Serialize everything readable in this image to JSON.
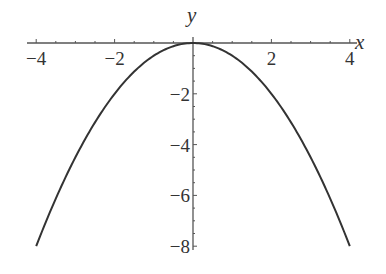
{
  "chart_data": {
    "type": "line",
    "title": "",
    "function": "y = -x^2/2",
    "xlabel": "x",
    "ylabel": "y",
    "xlim": [
      -4,
      4
    ],
    "ylim": [
      -8,
      0
    ],
    "x_ticks": [
      -4,
      -2,
      2,
      4
    ],
    "x_tick_labels": [
      "-4",
      "-2",
      "2",
      "4"
    ],
    "y_ticks": [
      -2,
      -4,
      -6,
      -8
    ],
    "y_tick_labels": [
      "-2",
      "-4",
      "-6",
      "-8"
    ],
    "grid": false,
    "legend": null,
    "series": [
      {
        "name": "parabola",
        "x": [
          -4,
          -3,
          -2,
          -1,
          0,
          1,
          2,
          3,
          4
        ],
        "y": [
          -8,
          -4.5,
          -2,
          -0.5,
          0,
          -0.5,
          -2,
          -4.5,
          -8
        ]
      }
    ],
    "colors": {
      "curve": "#333333",
      "axis": "#555555",
      "text": "#333333"
    }
  }
}
